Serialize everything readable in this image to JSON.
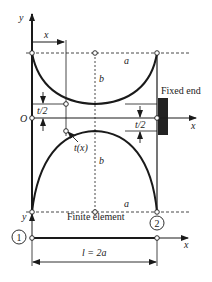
{
  "diagram": {
    "colors": {
      "line": "#1a1a1a",
      "fixed_end": "#222222",
      "background": "#ffffff"
    },
    "top_figure": {
      "axis_y_label": "y",
      "axis_x_label": "x",
      "origin_label": "O",
      "dim_x_label": "x",
      "half_length_top_label": "a",
      "half_length_bottom_label": "a",
      "height_top_label": "b",
      "height_bottom_label": "b",
      "half_thickness_left_label": "t/2",
      "half_thickness_right_label": "t/2",
      "thickness_label": "t(x)",
      "fixed_end_label": "Fixed end"
    },
    "bottom_figure": {
      "axis_y_label": "y",
      "axis_x_label": "x",
      "title": "Finite element",
      "node_1_label": "1",
      "node_2_label": "2",
      "length_label": "l = 2a"
    }
  }
}
